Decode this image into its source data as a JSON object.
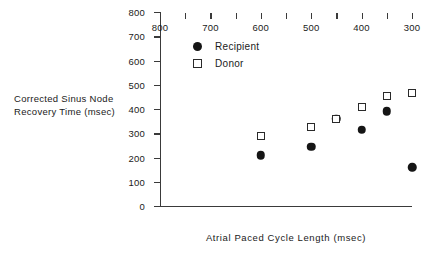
{
  "chart_data": {
    "type": "scatter",
    "title": "",
    "xlabel": "Atrial Paced Cycle Length (msec)",
    "ylabel": "Corrected Sinus Node\nRecovery Time (msec)",
    "xlim": [
      800,
      300
    ],
    "ylim": [
      0,
      800
    ],
    "x_axis_reversed": true,
    "grid": false,
    "legend_position": "upper-left-inside",
    "xticks": [
      800,
      700,
      600,
      500,
      400,
      300
    ],
    "xticks_minor": [
      750,
      650,
      550,
      450,
      350
    ],
    "yticks": [
      0,
      100,
      200,
      300,
      400,
      500,
      600,
      700,
      800
    ],
    "series": [
      {
        "name": "Recipient",
        "marker": "filled-circle",
        "color": "#151515",
        "points": [
          {
            "x": 600,
            "y": 210
          },
          {
            "x": 500,
            "y": 245
          },
          {
            "x": 450,
            "y": 360
          },
          {
            "x": 400,
            "y": 315
          },
          {
            "x": 350,
            "y": 390
          },
          {
            "x": 300,
            "y": 160
          }
        ]
      },
      {
        "name": "Donor",
        "marker": "open-square",
        "color": "#2a2a2a",
        "points": [
          {
            "x": 600,
            "y": 290
          },
          {
            "x": 500,
            "y": 325
          },
          {
            "x": 450,
            "y": 360
          },
          {
            "x": 400,
            "y": 410
          },
          {
            "x": 350,
            "y": 455
          },
          {
            "x": 300,
            "y": 465
          }
        ]
      }
    ],
    "legend": [
      {
        "label": "Recipient",
        "marker": "filled-circle"
      },
      {
        "label": "Donor",
        "marker": "open-square"
      }
    ]
  }
}
